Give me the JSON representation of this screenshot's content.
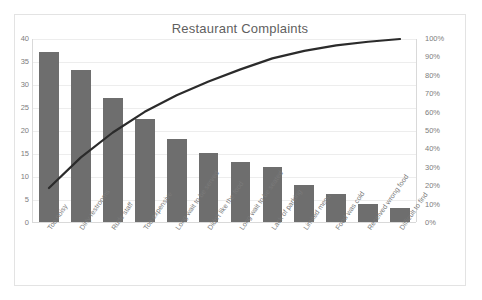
{
  "chart_data": {
    "type": "bar",
    "title": "Restaurant Complaints",
    "xlabel": "",
    "ylabel": "",
    "ylim": [
      0,
      40
    ],
    "y2lim": [
      0,
      100
    ],
    "grid": true,
    "legend": "none",
    "categories": [
      "Too noisy",
      "Dirty restrooms",
      "Rude staff",
      "Too expensive",
      "Long wait to be served",
      "Didn't like the food",
      "Long wait to be seated",
      "Lack of parking",
      "Limited menu",
      "Food was cold",
      "Received wrong food",
      "Difficult to find"
    ],
    "values": [
      37,
      33,
      27,
      22.5,
      18,
      15,
      13,
      12,
      8,
      6,
      4,
      3
    ],
    "cumulative_percent": [
      18.6,
      35.3,
      48.9,
      60.2,
      69.3,
      76.8,
      83.4,
      89.4,
      93.5,
      96.5,
      98.5,
      100
    ],
    "yticks": [
      0,
      5,
      10,
      15,
      20,
      25,
      30,
      35,
      40
    ],
    "y2ticks": [
      "0%",
      "10%",
      "20%",
      "30%",
      "40%",
      "50%",
      "60%",
      "70%",
      "80%",
      "90%",
      "100%"
    ],
    "series": [
      {
        "name": "Complaint count",
        "type": "bar",
        "color": "#6e6e6e",
        "values": [
          37,
          33,
          27,
          22.5,
          18,
          15,
          13,
          12,
          8,
          6,
          4,
          3
        ]
      },
      {
        "name": "Cumulative percentage",
        "type": "line",
        "color": "#2b2b2b",
        "values": [
          18.6,
          35.3,
          48.9,
          60.2,
          69.3,
          76.8,
          83.4,
          89.4,
          93.5,
          96.5,
          98.5,
          100
        ]
      }
    ],
    "colors": {
      "bar": "#6e6e6e",
      "line": "#2b2b2b",
      "grid": "#ededed",
      "axis": "#d9d9d9",
      "text": "#7a7a7a"
    }
  }
}
